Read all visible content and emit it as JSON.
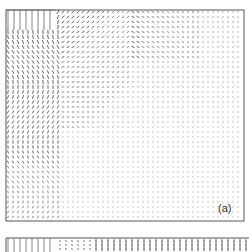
{
  "figure": {
    "panels": [
      {
        "id": "a",
        "label": "(a)",
        "content": "velocity vector field (quiver plot) in a rectangular domain with jet inlet at top-left",
        "features": [
          "inlet-region-top-left",
          "recirculation-vortex-left",
          "uniform-downward-flow-right"
        ]
      },
      {
        "id": "b",
        "label": "",
        "content": "velocity vector field (partially visible, cropped at bottom)",
        "features": [
          "inlet-region-left",
          "vertical-arrows-right"
        ]
      }
    ],
    "colors": {
      "background": "#ffffff",
      "frame": "#555555",
      "arrows": "#333333"
    }
  }
}
